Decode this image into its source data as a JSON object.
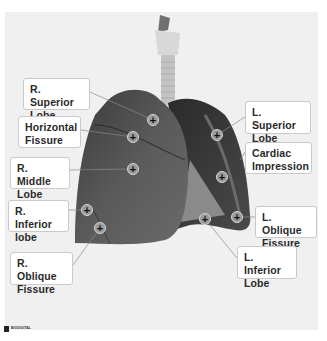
{
  "diagram": {
    "background_color": "#f0f0f0",
    "labels": [
      {
        "id": "r-superior-lobe",
        "lines": [
          "R. Superior",
          "Lobe"
        ],
        "box": [
          23,
          78,
          67,
          32
        ],
        "marker": [
          153,
          120
        ],
        "line_from": [
          90,
          92
        ]
      },
      {
        "id": "horizontal-fissure",
        "lines": [
          "Horizontal",
          "Fissure"
        ],
        "box": [
          18,
          116,
          63,
          32
        ],
        "marker": [
          133,
          137
        ],
        "line_from": [
          81,
          130
        ]
      },
      {
        "id": "r-middle-lobe",
        "lines": [
          "R. Middle",
          "Lobe"
        ],
        "box": [
          10,
          157,
          60,
          32
        ],
        "marker": [
          133,
          169
        ],
        "line_from": [
          70,
          170
        ]
      },
      {
        "id": "r-inferior-lobe",
        "lines": [
          "R. Inferior",
          "lobe"
        ],
        "box": [
          8,
          200,
          61,
          32
        ],
        "marker": [
          87,
          210
        ],
        "line_from": [
          69,
          210
        ]
      },
      {
        "id": "r-oblique-fissure",
        "lines": [
          "R. Oblique",
          "Fissure"
        ],
        "box": [
          10,
          252,
          63,
          33
        ],
        "marker": [
          100,
          228
        ],
        "line_from": [
          73,
          265
        ]
      },
      {
        "id": "l-superior-lobe",
        "lines": [
          "L. Superior",
          "Lobe"
        ],
        "box": [
          245,
          101,
          66,
          33
        ],
        "marker": [
          217,
          135
        ],
        "line_from": [
          245,
          117
        ]
      },
      {
        "id": "cardiac-impression",
        "lines": [
          "Cardiac",
          "Impression"
        ],
        "box": [
          245,
          142,
          67,
          32
        ],
        "marker": [
          222,
          177
        ],
        "line_from": [
          245,
          152
        ]
      },
      {
        "id": "l-oblique-fissure",
        "lines": [
          "L. Oblique",
          "Fissure"
        ],
        "box": [
          255,
          206,
          62,
          32
        ],
        "marker": [
          237,
          217
        ],
        "line_from": [
          255,
          217
        ]
      },
      {
        "id": "l-inferior-lobe",
        "lines": [
          "L. Inferior",
          "Lobe"
        ],
        "box": [
          237,
          246,
          60,
          33
        ],
        "marker": [
          205,
          219
        ],
        "line_from": [
          237,
          258
        ]
      }
    ]
  },
  "logo": {
    "line1": "BIODIGITAL",
    "line2": ""
  }
}
